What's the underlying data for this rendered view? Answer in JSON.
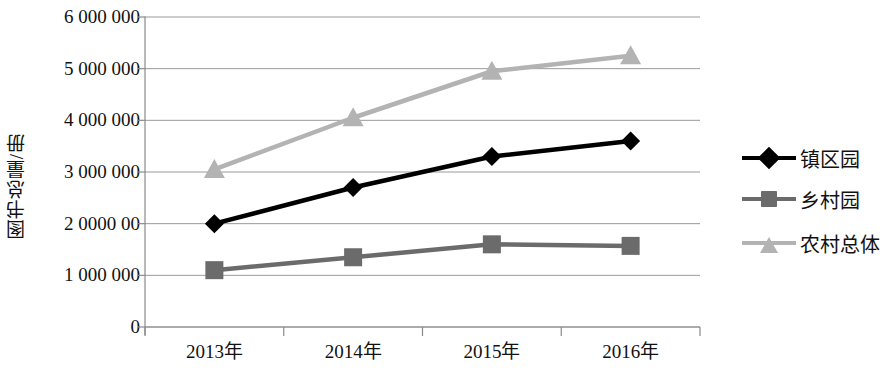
{
  "chart_data": {
    "type": "line",
    "title": "",
    "xlabel": "",
    "ylabel": "图书总量/册",
    "categories": [
      "2013年",
      "2014年",
      "2015年",
      "2016年"
    ],
    "ylim": [
      0,
      6000000
    ],
    "ytick_values": [
      0,
      1000000,
      2000000,
      3000000,
      4000000,
      5000000,
      6000000
    ],
    "ytick_labels": [
      "0",
      "1 000 000",
      "2 0000 00",
      "3 000 000",
      "4 000 000",
      "5 000 000",
      "6 000 000"
    ],
    "grid": true,
    "legend_position": "right",
    "series": [
      {
        "name": "镇区园",
        "color": "#000000",
        "marker": "diamond",
        "values": [
          2000000,
          2700000,
          3300000,
          3600000
        ]
      },
      {
        "name": "乡村园",
        "color": "#6b6b6b",
        "marker": "square",
        "values": [
          1100000,
          1350000,
          1600000,
          1570000
        ]
      },
      {
        "name": "农村总体",
        "color": "#b3b3b3",
        "marker": "triangle",
        "values": [
          3050000,
          4050000,
          4950000,
          5250000
        ]
      }
    ]
  },
  "axis": {
    "line_color": "#8a8a8a",
    "grid_color": "#9a9a9a"
  }
}
